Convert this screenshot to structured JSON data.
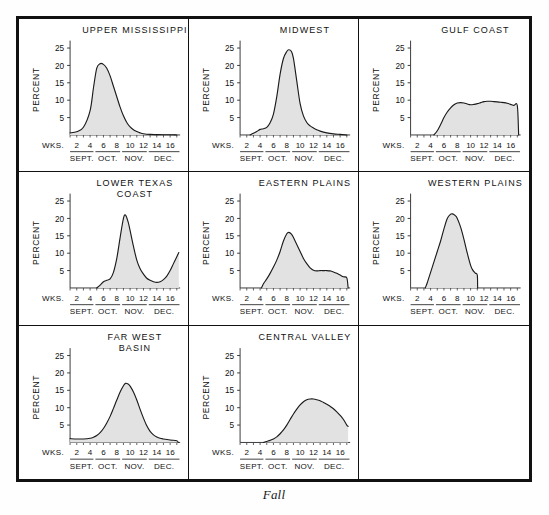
{
  "figure": {
    "caption": "Fall",
    "axis": {
      "ylabel": "PERCENT",
      "yticks": [
        5,
        10,
        15,
        20,
        25
      ],
      "ylim": [
        0,
        26
      ],
      "xlabel": "WKS.",
      "xticks": [
        2,
        4,
        6,
        8,
        10,
        12,
        14,
        16
      ],
      "xlim": [
        1,
        17.5
      ],
      "months": [
        "SEPT.",
        "OCT.",
        "NOV.",
        "DEC."
      ],
      "month_spans": [
        [
          1,
          4.5
        ],
        [
          4.8,
          8.5
        ],
        [
          8.8,
          12.5
        ],
        [
          12.8,
          17.4
        ]
      ],
      "fill_color": "#e2e2e2",
      "line_color": "#1a1a1a"
    },
    "artwork": {
      "name": "flying-geese-illustration",
      "count": 3
    },
    "panels": [
      {
        "id": "upper-mississippi",
        "title": "UPPER MISSISSIPPI",
        "title_lines": [
          "UPPER MISSISSIPPI"
        ],
        "chart_data": {
          "type": "area",
          "title": "UPPER MISSISSIPPI",
          "xlabel": "WKS.",
          "ylabel": "PERCENT",
          "ylim": [
            0,
            26
          ],
          "xlim": [
            1,
            17.5
          ],
          "x": [
            1,
            2,
            3,
            4,
            4.5,
            5,
            5.5,
            6,
            6.5,
            7,
            7.5,
            8,
            8.5,
            9,
            9.5,
            10,
            10.5,
            11,
            11.5,
            12,
            13,
            14,
            15,
            16,
            17
          ],
          "values": [
            0.6,
            0.9,
            2.2,
            7.0,
            13.5,
            19.2,
            20.5,
            20.3,
            19.2,
            17.0,
            14.0,
            11.0,
            8.0,
            5.5,
            3.6,
            2.3,
            1.5,
            1.0,
            0.6,
            0.35,
            0.15,
            0.1,
            0.05,
            0.05,
            0.0
          ]
        }
      },
      {
        "id": "midwest",
        "title": "MIDWEST",
        "title_lines": [
          "MIDWEST"
        ],
        "chart_data": {
          "type": "area",
          "title": "MIDWEST",
          "xlabel": "WKS.",
          "ylabel": "PERCENT",
          "ylim": [
            0,
            26
          ],
          "xlim": [
            1,
            17.5
          ],
          "x": [
            2.5,
            3,
            3.5,
            4,
            4.5,
            5,
            5.5,
            6,
            6.5,
            7,
            7.5,
            8,
            8.3,
            8.7,
            9,
            9.5,
            10,
            10.5,
            11,
            11.5,
            12,
            12.5,
            13,
            14,
            15,
            16,
            17
          ],
          "values": [
            0.0,
            0.5,
            1.0,
            1.6,
            1.8,
            2.2,
            3.5,
            6.0,
            11.0,
            17.5,
            22.0,
            24.0,
            24.5,
            24.0,
            22.0,
            15.5,
            9.0,
            5.5,
            3.6,
            2.6,
            2.0,
            1.5,
            1.1,
            0.6,
            0.3,
            0.15,
            0.0
          ]
        }
      },
      {
        "id": "gulf-coast",
        "title": "GULF COAST",
        "title_lines": [
          "GULF COAST"
        ],
        "chart_data": {
          "type": "area",
          "title": "GULF COAST",
          "xlabel": "WKS.",
          "ylabel": "PERCENT",
          "ylim": [
            0,
            26
          ],
          "xlim": [
            1,
            17.5
          ],
          "x": [
            4.5,
            5,
            5.5,
            6,
            6.5,
            7,
            7.5,
            8,
            8.5,
            9,
            9.5,
            10,
            10.5,
            11,
            11.5,
            12,
            12.5,
            13,
            13.5,
            14,
            14.5,
            15,
            15.5,
            16,
            16.5,
            17,
            17.2
          ],
          "values": [
            0.0,
            1.2,
            3.0,
            5.0,
            6.6,
            7.8,
            8.7,
            9.2,
            9.3,
            9.2,
            8.9,
            8.7,
            8.8,
            9.0,
            9.3,
            9.6,
            9.7,
            9.7,
            9.6,
            9.5,
            9.4,
            9.3,
            9.1,
            8.8,
            8.5,
            8.4,
            0.0
          ]
        }
      },
      {
        "id": "lower-texas-coast",
        "title": "LOWER TEXAS COAST",
        "title_lines": [
          "LOWER TEXAS",
          "COAST"
        ],
        "chart_data": {
          "type": "area",
          "title": "LOWER TEXAS COAST",
          "xlabel": "WKS.",
          "ylabel": "PERCENT",
          "ylim": [
            0,
            26
          ],
          "xlim": [
            1,
            17.5
          ],
          "x": [
            5,
            5.5,
            6,
            6.5,
            7,
            7.5,
            8,
            8.5,
            9,
            9.3,
            9.7,
            10,
            10.5,
            11,
            11.5,
            12,
            12.5,
            13,
            13.5,
            14,
            14.5,
            15,
            15.5,
            16,
            16.5,
            17,
            17.3
          ],
          "values": [
            0.0,
            0.8,
            1.8,
            2.2,
            2.6,
            4.5,
            8.5,
            14.5,
            20.0,
            21.0,
            19.0,
            16.5,
            12.0,
            8.0,
            5.5,
            4.0,
            2.8,
            2.2,
            1.8,
            1.6,
            1.8,
            2.4,
            3.4,
            5.0,
            7.0,
            9.0,
            10.2
          ]
        }
      },
      {
        "id": "eastern-plains",
        "title": "EASTERN PLAINS",
        "title_lines": [
          "EASTERN PLAINS"
        ],
        "chart_data": {
          "type": "area",
          "title": "EASTERN PLAINS",
          "xlabel": "WKS.",
          "ylabel": "PERCENT",
          "ylim": [
            0,
            26
          ],
          "xlim": [
            1,
            17.5
          ],
          "x": [
            4.2,
            4.5,
            5,
            5.5,
            6,
            6.5,
            7,
            7.5,
            8,
            8.3,
            8.7,
            9,
            9.5,
            10,
            10.5,
            11,
            11.5,
            12,
            12.5,
            13,
            13.5,
            14,
            14.5,
            15,
            15.5,
            16,
            16.5,
            17,
            17.2
          ],
          "values": [
            0.0,
            1.2,
            2.6,
            4.2,
            6.0,
            8.0,
            10.5,
            13.5,
            15.6,
            16.0,
            15.5,
            14.5,
            12.5,
            10.5,
            8.5,
            7.0,
            5.8,
            5.1,
            4.9,
            5.0,
            5.0,
            5.0,
            4.9,
            4.6,
            4.2,
            3.7,
            3.2,
            2.9,
            0.0
          ]
        }
      },
      {
        "id": "western-plains",
        "title": "WESTERN PLAINS",
        "title_lines": [
          "WESTERN PLAINS"
        ],
        "chart_data": {
          "type": "area",
          "title": "WESTERN PLAINS",
          "xlabel": "WKS.",
          "ylabel": "PERCENT",
          "ylim": [
            0,
            26
          ],
          "xlim": [
            1,
            17.5
          ],
          "x": [
            3.2,
            3.5,
            4,
            4.5,
            5,
            5.5,
            6,
            6.5,
            7,
            7.3,
            7.7,
            8,
            8.5,
            9,
            9.5,
            10,
            10.3,
            10.7,
            11,
            11.05
          ],
          "values": [
            0.0,
            1.5,
            4.5,
            7.5,
            10.5,
            13.5,
            17.0,
            20.0,
            21.2,
            21.3,
            20.8,
            20.0,
            17.5,
            14.0,
            10.0,
            6.5,
            5.2,
            4.3,
            3.7,
            0.0
          ]
        }
      },
      {
        "id": "far-west-basin",
        "title": "FAR WEST BASIN",
        "title_lines": [
          "FAR WEST",
          "BASIN"
        ],
        "chart_data": {
          "type": "area",
          "title": "FAR WEST BASIN",
          "xlabel": "WKS.",
          "ylabel": "PERCENT",
          "ylim": [
            0,
            26
          ],
          "xlim": [
            1,
            17.5
          ],
          "x": [
            1,
            2,
            3,
            4,
            4.5,
            5,
            5.5,
            6,
            6.5,
            7,
            7.5,
            8,
            8.5,
            9,
            9.3,
            9.7,
            10,
            10.5,
            11,
            11.5,
            12,
            12.5,
            13,
            13.5,
            14,
            14.5,
            15,
            16,
            17,
            17.2
          ],
          "values": [
            1.1,
            1.0,
            1.0,
            1.2,
            1.5,
            2.0,
            2.8,
            4.0,
            5.6,
            7.5,
            9.8,
            12.2,
            14.5,
            16.3,
            17.0,
            16.8,
            16.2,
            14.5,
            12.2,
            9.5,
            7.0,
            4.8,
            3.2,
            2.2,
            1.6,
            1.2,
            1.0,
            0.7,
            0.5,
            0.0
          ]
        }
      },
      {
        "id": "central-valley",
        "title": "CENTRAL VALLEY",
        "title_lines": [
          "CENTRAL VALLEY"
        ],
        "chart_data": {
          "type": "area",
          "title": "CENTRAL VALLEY",
          "xlabel": "WKS.",
          "ylabel": "PERCENT",
          "ylim": [
            0,
            26
          ],
          "xlim": [
            1,
            17.5
          ],
          "x": [
            4.5,
            5,
            5.5,
            6,
            6.5,
            7,
            7.5,
            8,
            8.5,
            9,
            9.5,
            10,
            10.5,
            11,
            11.5,
            12,
            12.5,
            13,
            13.5,
            14,
            14.5,
            15,
            15.5,
            16,
            16.5,
            17,
            17.2
          ],
          "values": [
            0.0,
            0.3,
            0.6,
            1.0,
            1.6,
            2.5,
            3.6,
            5.0,
            6.6,
            8.2,
            9.6,
            10.8,
            11.7,
            12.3,
            12.5,
            12.5,
            12.3,
            12.0,
            11.5,
            11.0,
            10.4,
            9.7,
            8.8,
            7.8,
            6.6,
            5.0,
            4.6
          ]
        }
      }
    ]
  }
}
